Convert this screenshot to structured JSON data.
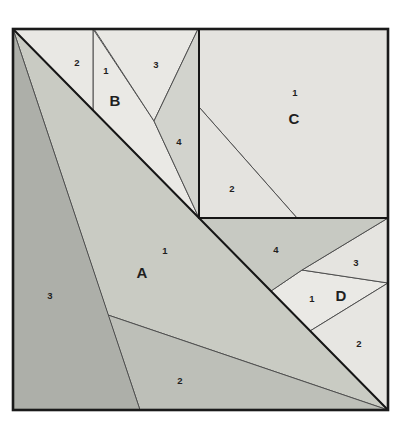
{
  "diagram": {
    "canvas": {
      "width": 410,
      "height": 429,
      "background": "#ffffff"
    },
    "outer_square": {
      "x": 13,
      "y": 29,
      "w": 375,
      "h": 381,
      "stroke": "#1a1a1a",
      "stroke_width": 2.6
    },
    "seam_stroke": {
      "color": "#4f4f4f",
      "width": 1
    },
    "unit_boundary_stroke": {
      "color": "#161616",
      "width": 2
    },
    "pieces": [
      {
        "id": "A1",
        "unit": "A",
        "number": "1",
        "fill": "#c9cbc3",
        "points": [
          [
            13,
            29
          ],
          [
            388,
            410
          ],
          [
            108,
            315
          ]
        ]
      },
      {
        "id": "A2",
        "unit": "A",
        "number": "2",
        "fill": "#bdbfb8",
        "points": [
          [
            108,
            315
          ],
          [
            388,
            410
          ],
          [
            140,
            410
          ]
        ]
      },
      {
        "id": "A3",
        "unit": "A",
        "number": "3",
        "fill": "#adafa9",
        "points": [
          [
            13,
            29
          ],
          [
            140,
            410
          ],
          [
            13,
            410
          ]
        ]
      },
      {
        "id": "B1",
        "unit": "B",
        "number": "1",
        "fill": "#eae9e5",
        "points": [
          [
            93,
            29
          ],
          [
            154,
            121
          ],
          [
            199,
            218
          ],
          [
            93,
            110
          ]
        ]
      },
      {
        "id": "B2",
        "unit": "B",
        "number": "2",
        "fill": "#e9e8e4",
        "points": [
          [
            13,
            29
          ],
          [
            93,
            29
          ],
          [
            93,
            110
          ]
        ]
      },
      {
        "id": "B3",
        "unit": "B",
        "number": "3",
        "fill": "#e9e8e4",
        "points": [
          [
            94,
            29
          ],
          [
            198,
            29
          ],
          [
            154,
            121
          ]
        ]
      },
      {
        "id": "B4",
        "unit": "B",
        "number": "4",
        "fill": "#d2d3cd",
        "points": [
          [
            198,
            29
          ],
          [
            199,
            29
          ],
          [
            199,
            218
          ],
          [
            154,
            121
          ]
        ]
      },
      {
        "id": "C1",
        "unit": "C",
        "number": "1",
        "fill": "#e4e3df",
        "points": [
          [
            199,
            29
          ],
          [
            388,
            29
          ],
          [
            388,
            218
          ],
          [
            297,
            218
          ],
          [
            199,
            107
          ]
        ]
      },
      {
        "id": "C2",
        "unit": "C",
        "number": "2",
        "fill": "#e4e3df",
        "points": [
          [
            199,
            107
          ],
          [
            297,
            218
          ],
          [
            199,
            218
          ]
        ]
      },
      {
        "id": "D1",
        "unit": "D",
        "number": "1",
        "fill": "#eae9e5",
        "points": [
          [
            302,
            270
          ],
          [
            388,
            283
          ],
          [
            310,
            331
          ],
          [
            271,
            291
          ]
        ]
      },
      {
        "id": "D2",
        "unit": "D",
        "number": "2",
        "fill": "#e7e6e2",
        "points": [
          [
            388,
            283
          ],
          [
            388,
            410
          ],
          [
            310,
            331
          ]
        ]
      },
      {
        "id": "D3",
        "unit": "D",
        "number": "3",
        "fill": "#e5e4e0",
        "points": [
          [
            388,
            218
          ],
          [
            388,
            283
          ],
          [
            302,
            270
          ]
        ]
      },
      {
        "id": "D4",
        "unit": "D",
        "number": "4",
        "fill": "#c7c9c2",
        "points": [
          [
            199,
            218
          ],
          [
            388,
            218
          ],
          [
            302,
            270
          ],
          [
            271,
            291
          ]
        ]
      }
    ],
    "unit_boundaries": [
      {
        "name": "main-diagonal",
        "points": [
          [
            13,
            29
          ],
          [
            388,
            410
          ]
        ]
      },
      {
        "name": "unit-c-left-edge",
        "points": [
          [
            199,
            29
          ],
          [
            199,
            218
          ]
        ]
      },
      {
        "name": "unit-c-bottom-edge",
        "points": [
          [
            199,
            218
          ],
          [
            388,
            218
          ]
        ]
      }
    ],
    "labels": [
      {
        "text": "2",
        "x": 77,
        "y": 62,
        "kind": "number"
      },
      {
        "text": "1",
        "x": 106,
        "y": 70,
        "kind": "number"
      },
      {
        "text": "B",
        "x": 115,
        "y": 100,
        "kind": "unit"
      },
      {
        "text": "3",
        "x": 156,
        "y": 64,
        "kind": "number"
      },
      {
        "text": "4",
        "x": 179,
        "y": 141,
        "kind": "number"
      },
      {
        "text": "1",
        "x": 295,
        "y": 92,
        "kind": "number"
      },
      {
        "text": "C",
        "x": 294,
        "y": 118,
        "kind": "unit"
      },
      {
        "text": "2",
        "x": 232,
        "y": 188,
        "kind": "number"
      },
      {
        "text": "1",
        "x": 165,
        "y": 250,
        "kind": "number"
      },
      {
        "text": "A",
        "x": 142,
        "y": 272,
        "kind": "unit"
      },
      {
        "text": "3",
        "x": 50,
        "y": 295,
        "kind": "number"
      },
      {
        "text": "2",
        "x": 180,
        "y": 380,
        "kind": "number"
      },
      {
        "text": "4",
        "x": 276,
        "y": 249,
        "kind": "number"
      },
      {
        "text": "3",
        "x": 356,
        "y": 262,
        "kind": "number"
      },
      {
        "text": "1",
        "x": 312,
        "y": 298,
        "kind": "number"
      },
      {
        "text": "D",
        "x": 341,
        "y": 295,
        "kind": "unit"
      },
      {
        "text": "2",
        "x": 359,
        "y": 343,
        "kind": "number"
      }
    ],
    "label_style": {
      "number_font_size": 9.5,
      "unit_font_size": 15,
      "color": "#1f1f1f"
    }
  }
}
